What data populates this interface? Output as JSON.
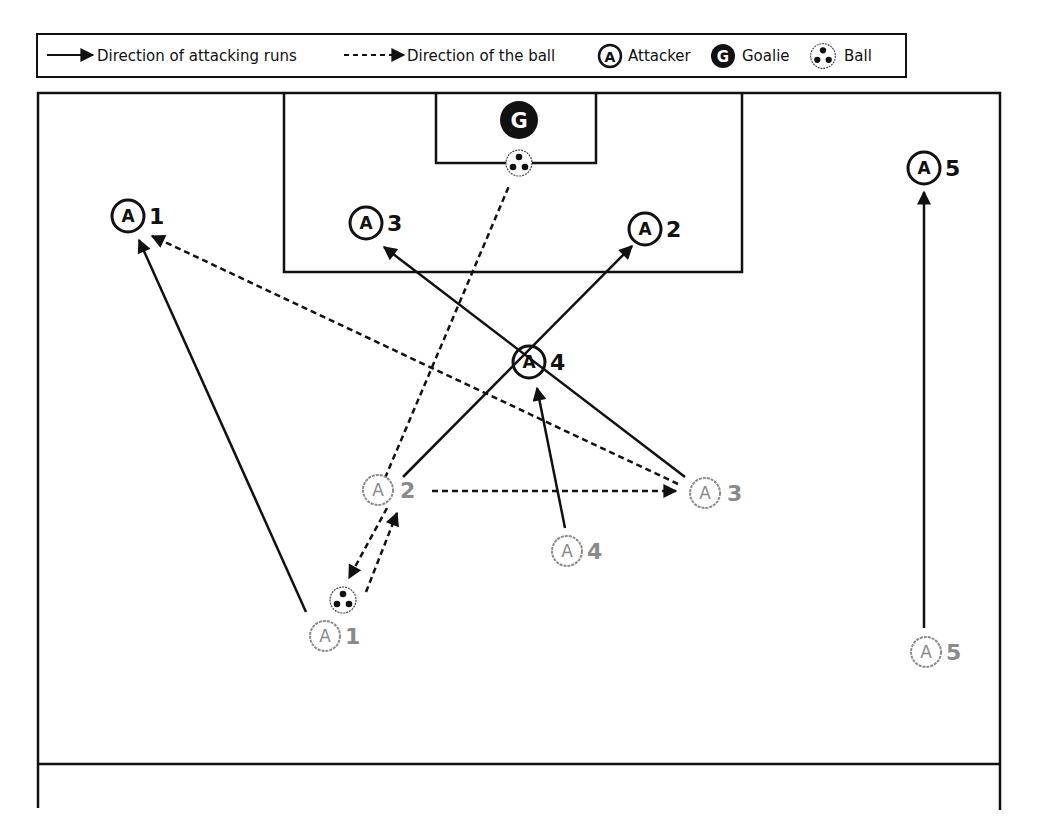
{
  "legend": {
    "run_label": "Direction of attacking runs",
    "ball_label": "Direction of the ball",
    "attacker_label": "Attacker",
    "goalie_label": "Goalie",
    "ball_icon_label": "Ball",
    "attacker_glyph": "A",
    "goalie_glyph": "G"
  },
  "colors": {
    "line": "#111111",
    "start_position": "#8a8a8a",
    "end_position": "#111111",
    "goalie_fill": "#111111"
  },
  "players": {
    "start": [
      {
        "id": "1",
        "glyph": "A",
        "label": "1"
      },
      {
        "id": "2",
        "glyph": "A",
        "label": "2"
      },
      {
        "id": "3",
        "glyph": "A",
        "label": "3"
      },
      {
        "id": "4",
        "glyph": "A",
        "label": "4"
      },
      {
        "id": "5",
        "glyph": "A",
        "label": "5"
      }
    ],
    "end": [
      {
        "id": "1",
        "glyph": "A",
        "label": "1"
      },
      {
        "id": "2",
        "glyph": "A",
        "label": "2"
      },
      {
        "id": "3",
        "glyph": "A",
        "label": "3"
      },
      {
        "id": "4",
        "glyph": "A",
        "label": "4"
      },
      {
        "id": "5",
        "glyph": "A",
        "label": "5"
      }
    ],
    "goalie": {
      "glyph": "G"
    }
  }
}
